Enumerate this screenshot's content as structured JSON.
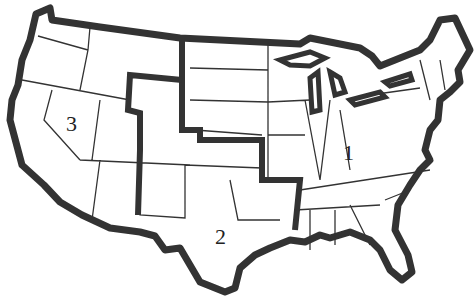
{
  "map": {
    "title": "",
    "colors": {
      "outline": "#333333",
      "background": "#ffffff"
    },
    "regions": [
      {
        "id": "1",
        "label": "1",
        "x": 345,
        "y": 143
      },
      {
        "id": "2",
        "label": "2",
        "x": 217,
        "y": 226
      },
      {
        "id": "3",
        "label": "3",
        "x": 67,
        "y": 113
      }
    ]
  }
}
